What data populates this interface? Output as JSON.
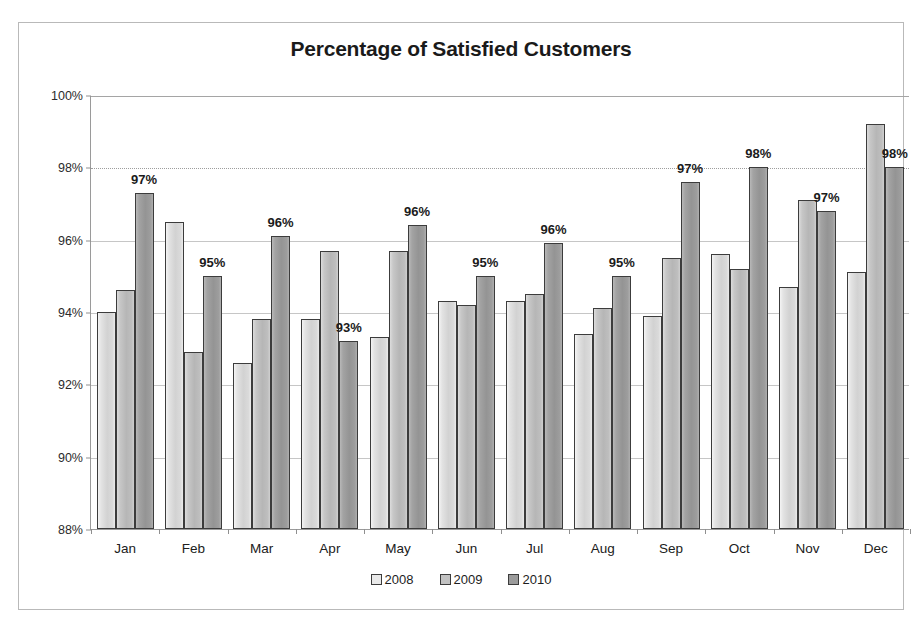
{
  "chart_data": {
    "type": "bar",
    "title": "Percentage of Satisfied Customers",
    "xlabel": "",
    "ylabel": "",
    "ylim": [
      88,
      100
    ],
    "ytick_step": 2,
    "ytick_labels": [
      "100%",
      "98%",
      "96%",
      "94%",
      "92%",
      "90%",
      "88%"
    ],
    "ytick_values": [
      100,
      98,
      96,
      94,
      92,
      90,
      88
    ],
    "grid": true,
    "legend_position": "bottom",
    "categories": [
      "Jan",
      "Feb",
      "Mar",
      "Apr",
      "May",
      "Jun",
      "Jul",
      "Aug",
      "Sep",
      "Oct",
      "Nov",
      "Dec"
    ],
    "series": [
      {
        "name": "2008",
        "color": "#e9e9e9",
        "values": [
          94.0,
          96.5,
          92.6,
          93.8,
          93.3,
          94.3,
          94.3,
          93.4,
          93.9,
          95.6,
          94.7,
          95.1
        ]
      },
      {
        "name": "2009",
        "color": "#c2c2c2",
        "values": [
          94.6,
          92.9,
          93.8,
          95.7,
          95.7,
          94.2,
          94.5,
          94.1,
          95.5,
          95.2,
          97.1,
          99.2
        ]
      },
      {
        "name": "2010",
        "color": "#9b9b9b",
        "values": [
          97.3,
          95.0,
          96.1,
          93.2,
          96.4,
          95.0,
          95.9,
          95.0,
          97.6,
          98.0,
          96.8,
          98.0
        ]
      }
    ],
    "data_labels": {
      "series": "2010",
      "values": [
        "97%",
        "95%",
        "96%",
        "93%",
        "96%",
        "95%",
        "96%",
        "95%",
        "97%",
        "98%",
        "97%",
        "98%"
      ]
    }
  },
  "legend": {
    "items": [
      {
        "label": "2008",
        "key": "y2008"
      },
      {
        "label": "2009",
        "key": "y2009"
      },
      {
        "label": "2010",
        "key": "y2010"
      }
    ]
  }
}
